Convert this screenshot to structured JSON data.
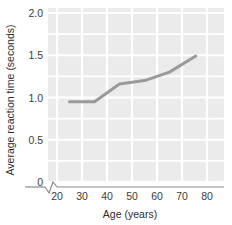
{
  "chart_data": {
    "type": "line",
    "title": "",
    "subtitle": "",
    "xlabel": "Age (years)",
    "ylabel": "Average reaction time (seconds)",
    "xlim": [
      20,
      85
    ],
    "ylim": [
      0,
      2.0
    ],
    "xticks": [
      20,
      30,
      40,
      50,
      60,
      70,
      80
    ],
    "xtick_labels": [
      "20",
      "30",
      "40",
      "50",
      "60",
      "70",
      "80"
    ],
    "yticks": [
      0,
      0.5,
      1.0,
      1.5,
      2.0
    ],
    "ytick_labels": [
      "0",
      "0.5",
      "1.0",
      "1.5",
      "2.0"
    ],
    "grid": true,
    "grid_color": "#ffffff",
    "plot_background": "#ebebeb",
    "axis_break": true,
    "axis_break_note": "zigzag break on x-axis between origin and first tick",
    "legend": null,
    "legend_position": "none",
    "series": [
      {
        "name": "Average reaction time",
        "color": "#9a9a9a",
        "line_width": 3,
        "x": [
          25,
          35,
          45,
          55,
          65,
          75.5
        ],
        "y": [
          0.95,
          0.95,
          1.16,
          1.2,
          1.3,
          1.49
        ]
      }
    ]
  },
  "axes": {
    "x_title": "Age (years)",
    "y_title": "Average reaction time (seconds)"
  }
}
